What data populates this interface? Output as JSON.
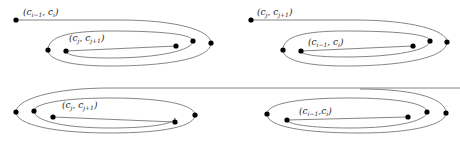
{
  "diagram": {
    "type": "curve-configurations",
    "stroke_color": "#777777",
    "dot_color": "#000000",
    "panels": [
      {
        "id": "top-left",
        "label": {
          "main": "(c",
          "sub1": "i−1",
          "mid": ", c",
          "sub2": "i",
          "end": ")"
        },
        "inner_label": {
          "main": "(c",
          "sub1": "j",
          "mid": ", c",
          "sub2": "j+1",
          "end": ")"
        }
      },
      {
        "id": "top-right",
        "label": {
          "main": "(c",
          "sub1": "j",
          "mid": ", c",
          "sub2": "j+1",
          "end": ")"
        },
        "inner_label": {
          "main": "(c",
          "sub1": "i−1",
          "mid": ", c",
          "sub2": "i",
          "end": ")"
        }
      },
      {
        "id": "bottom-left",
        "inner_label": {
          "main": "(c",
          "sub1": "j",
          "mid": ", c",
          "sub2": "j+1",
          "end": ")"
        }
      },
      {
        "id": "bottom-right",
        "inner_label": {
          "main": "(c",
          "sub1": "i−1",
          "mid": ",c",
          "sub2": "i",
          "end": ")"
        }
      }
    ]
  }
}
